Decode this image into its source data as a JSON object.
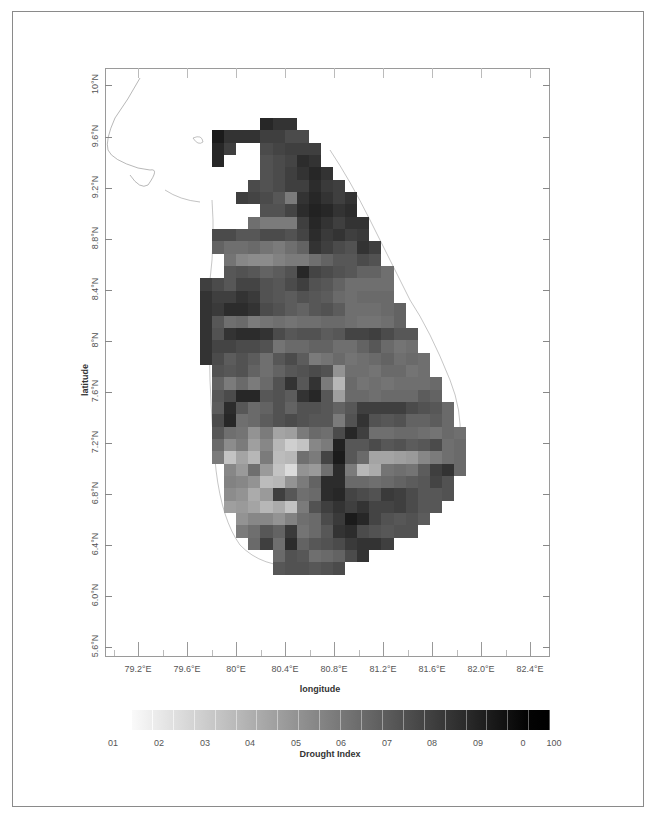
{
  "chart_data": {
    "type": "heatmap",
    "title": "",
    "xlabel": "longitude",
    "ylabel": "latitude",
    "x_ticks": [
      "79.2°E",
      "79.6°E",
      "80°E",
      "80.4°E",
      "80.8°E",
      "81.2°E",
      "81.6°E",
      "82.0°E",
      "82.4°E"
    ],
    "y_ticks": [
      "10°N",
      "9.6°N",
      "9.2°N",
      "8.8°N",
      "8.4°N",
      "8°N",
      "7.6°N",
      "7.2°N",
      "6.8°N",
      "6.4°N",
      "6.0°N",
      "5.6°N"
    ],
    "xlim": [
      78.9,
      82.5
    ],
    "ylim": [
      5.5,
      10.1
    ],
    "grid": false,
    "colorbar": {
      "label": "Drought Index",
      "tick_labels": [
        "01",
        "02",
        "03",
        "04",
        "05",
        "06",
        "07",
        "08",
        "09",
        "0",
        "100"
      ],
      "range": [
        0,
        100
      ],
      "colormap": "greys (white to black)"
    },
    "cell_grid": {
      "origin_lon": 79.55,
      "origin_lat": 9.82,
      "cell_deg": 0.094,
      "note": "Approximate drought index values per cell (0-100, higher = darker); null = no data",
      "rows": [
        [
          null,
          null,
          null,
          null,
          null,
          90,
          85,
          85,
          null,
          null,
          null,
          null,
          null,
          null,
          null,
          null,
          null,
          null,
          null,
          null,
          null,
          null,
          null
        ],
        [
          null,
          95,
          85,
          85,
          85,
          80,
          80,
          75,
          75,
          null,
          null,
          null,
          null,
          null,
          null,
          null,
          null,
          null,
          null,
          null,
          null,
          null,
          null
        ],
        [
          null,
          90,
          80,
          null,
          null,
          75,
          78,
          80,
          80,
          80,
          null,
          null,
          null,
          null,
          null,
          null,
          null,
          null,
          null,
          null,
          null,
          null,
          null
        ],
        [
          null,
          90,
          null,
          null,
          null,
          72,
          75,
          78,
          88,
          85,
          null,
          null,
          null,
          null,
          null,
          null,
          null,
          null,
          null,
          null,
          null,
          null,
          null
        ],
        [
          null,
          null,
          null,
          null,
          null,
          72,
          75,
          80,
          85,
          90,
          85,
          null,
          null,
          null,
          null,
          null,
          null,
          null,
          null,
          null,
          null,
          null,
          null
        ],
        [
          null,
          null,
          null,
          null,
          75,
          72,
          75,
          80,
          80,
          88,
          82,
          80,
          null,
          null,
          null,
          null,
          null,
          null,
          null,
          null,
          null,
          null,
          null
        ],
        [
          null,
          null,
          null,
          80,
          78,
          75,
          70,
          55,
          85,
          90,
          85,
          80,
          85,
          null,
          null,
          null,
          null,
          null,
          null,
          null,
          null,
          null,
          null
        ],
        [
          null,
          null,
          null,
          null,
          null,
          72,
          72,
          78,
          88,
          92,
          90,
          85,
          88,
          null,
          null,
          null,
          null,
          null,
          null,
          null,
          null,
          null,
          null
        ],
        [
          null,
          null,
          null,
          null,
          60,
          55,
          55,
          55,
          80,
          90,
          85,
          80,
          85,
          85,
          null,
          null,
          null,
          null,
          null,
          null,
          null,
          null,
          null
        ],
        [
          null,
          75,
          75,
          70,
          70,
          75,
          75,
          72,
          78,
          88,
          82,
          85,
          80,
          82,
          null,
          null,
          null,
          null,
          null,
          null,
          null,
          null,
          null
        ],
        [
          null,
          65,
          60,
          60,
          62,
          58,
          55,
          60,
          65,
          85,
          80,
          75,
          72,
          85,
          80,
          null,
          null,
          null,
          null,
          null,
          null,
          null,
          null
        ],
        [
          null,
          null,
          58,
          50,
          48,
          48,
          52,
          55,
          55,
          60,
          65,
          70,
          70,
          75,
          72,
          null,
          null,
          null,
          null,
          null,
          null,
          null,
          null
        ],
        [
          null,
          null,
          70,
          72,
          70,
          65,
          68,
          72,
          90,
          78,
          75,
          72,
          70,
          65,
          65,
          60,
          null,
          null,
          null,
          null,
          null,
          null,
          null
        ],
        [
          80,
          75,
          70,
          78,
          78,
          72,
          70,
          75,
          80,
          72,
          70,
          65,
          60,
          60,
          60,
          60,
          null,
          null,
          null,
          null,
          null,
          null,
          null
        ],
        [
          85,
          80,
          80,
          85,
          82,
          72,
          70,
          68,
          72,
          70,
          68,
          62,
          60,
          62,
          62,
          62,
          null,
          null,
          null,
          null,
          null,
          null,
          null
        ],
        [
          85,
          82,
          88,
          88,
          85,
          75,
          72,
          68,
          65,
          70,
          72,
          68,
          60,
          60,
          60,
          62,
          65,
          null,
          null,
          null,
          null,
          null,
          null
        ],
        [
          85,
          70,
          60,
          62,
          55,
          58,
          60,
          58,
          60,
          60,
          62,
          62,
          60,
          58,
          58,
          60,
          65,
          null,
          null,
          null,
          null,
          null,
          null
        ],
        [
          85,
          72,
          85,
          88,
          88,
          85,
          75,
          70,
          72,
          72,
          68,
          70,
          78,
          78,
          80,
          75,
          70,
          70,
          null,
          null,
          null,
          null,
          null
        ],
        [
          85,
          78,
          78,
          75,
          75,
          72,
          58,
          62,
          62,
          65,
          65,
          60,
          60,
          65,
          70,
          62,
          58,
          60,
          null,
          null,
          null,
          null,
          null
        ],
        [
          85,
          75,
          68,
          72,
          68,
          60,
          70,
          75,
          68,
          55,
          58,
          62,
          58,
          60,
          62,
          65,
          60,
          62,
          60,
          null,
          null,
          null,
          null
        ],
        [
          null,
          72,
          70,
          72,
          65,
          60,
          65,
          70,
          72,
          75,
          72,
          45,
          60,
          60,
          58,
          62,
          62,
          58,
          60,
          null,
          null,
          null,
          null
        ],
        [
          null,
          65,
          55,
          62,
          55,
          62,
          72,
          85,
          70,
          85,
          55,
          30,
          62,
          58,
          60,
          58,
          60,
          60,
          60,
          62,
          null,
          null,
          null
        ],
        [
          null,
          70,
          75,
          90,
          90,
          70,
          72,
          68,
          85,
          90,
          70,
          40,
          62,
          62,
          60,
          62,
          62,
          62,
          68,
          65,
          null,
          null,
          null
        ],
        [
          null,
          68,
          88,
          70,
          62,
          65,
          72,
          65,
          72,
          72,
          70,
          65,
          70,
          80,
          80,
          80,
          80,
          75,
          72,
          70,
          62,
          null,
          null
        ],
        [
          null,
          75,
          90,
          60,
          62,
          68,
          72,
          75,
          72,
          70,
          70,
          55,
          72,
          85,
          72,
          70,
          72,
          65,
          65,
          68,
          62,
          null,
          null
        ],
        [
          null,
          70,
          60,
          58,
          45,
          55,
          38,
          40,
          55,
          62,
          60,
          75,
          90,
          80,
          60,
          60,
          62,
          62,
          60,
          58,
          62,
          60,
          null
        ],
        [
          null,
          62,
          48,
          55,
          40,
          50,
          30,
          20,
          25,
          50,
          55,
          92,
          70,
          70,
          75,
          70,
          72,
          68,
          70,
          75,
          60,
          62,
          null
        ],
        [
          null,
          55,
          25,
          38,
          30,
          55,
          28,
          30,
          60,
          55,
          78,
          95,
          70,
          62,
          38,
          38,
          40,
          42,
          50,
          55,
          60,
          62,
          null
        ],
        [
          null,
          null,
          50,
          42,
          60,
          42,
          25,
          15,
          45,
          42,
          60,
          88,
          55,
          30,
          35,
          58,
          60,
          58,
          68,
          80,
          85,
          62,
          null
        ],
        [
          null,
          null,
          52,
          50,
          45,
          28,
          30,
          45,
          55,
          65,
          88,
          88,
          62,
          62,
          60,
          62,
          65,
          68,
          70,
          78,
          72,
          null,
          null
        ],
        [
          null,
          null,
          48,
          45,
          35,
          42,
          80,
          70,
          60,
          62,
          88,
          90,
          78,
          75,
          72,
          82,
          80,
          75,
          70,
          70,
          72,
          null,
          null
        ],
        [
          null,
          null,
          40,
          42,
          38,
          30,
          35,
          25,
          55,
          72,
          80,
          85,
          80,
          85,
          78,
          78,
          80,
          75,
          70,
          70,
          null,
          null,
          null
        ],
        [
          null,
          null,
          null,
          45,
          50,
          50,
          45,
          52,
          60,
          62,
          75,
          82,
          95,
          90,
          78,
          72,
          70,
          72,
          68,
          null,
          null,
          null,
          null
        ],
        [
          null,
          null,
          null,
          55,
          60,
          70,
          65,
          82,
          58,
          62,
          70,
          85,
          88,
          75,
          72,
          70,
          72,
          72,
          null,
          null,
          null,
          null,
          null
        ],
        [
          null,
          null,
          null,
          null,
          62,
          80,
          60,
          88,
          65,
          70,
          72,
          75,
          82,
          85,
          85,
          80,
          null,
          null,
          null,
          null,
          null,
          null,
          null
        ],
        [
          null,
          null,
          null,
          null,
          null,
          null,
          62,
          72,
          70,
          60,
          62,
          65,
          75,
          85,
          null,
          null,
          null,
          null,
          null,
          null,
          null,
          null,
          null
        ],
        [
          null,
          null,
          null,
          null,
          null,
          null,
          70,
          72,
          72,
          70,
          72,
          75,
          null,
          null,
          null,
          null,
          null,
          null,
          null,
          null,
          null,
          null,
          null
        ]
      ]
    }
  },
  "axes": {
    "x_title": "longitude",
    "y_title": "latitude",
    "x_ticks": [
      "79.2°E",
      "79.6°E",
      "80°E",
      "80.4°E",
      "80.8°E",
      "81.2°E",
      "81.6°E",
      "82.0°E",
      "82.4°E"
    ],
    "y_ticks": [
      "10°N",
      "9.6°N",
      "9.2°N",
      "8.8°N",
      "8.4°N",
      "8°N",
      "7.6°N",
      "7.2°N",
      "6.8°N",
      "6.4°N",
      "6.0°N",
      "5.6°N"
    ]
  },
  "colorbar": {
    "title": "Drought Index",
    "labels": [
      "01",
      "02",
      "03",
      "04",
      "05",
      "06",
      "07",
      "08",
      "09",
      "0",
      "100"
    ]
  }
}
